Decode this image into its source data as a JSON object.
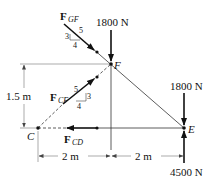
{
  "diagram": {
    "nodes": {
      "C": {
        "label": "C"
      },
      "F": {
        "label": "F"
      },
      "E": {
        "label": "E"
      }
    },
    "forces": {
      "F_GF": {
        "symbol": "F",
        "subscript": "GF",
        "slope_rise": "3",
        "slope_run": "4",
        "slope_hyp": "5"
      },
      "F_CF": {
        "symbol": "F",
        "subscript": "CF",
        "slope_rise": "3",
        "slope_run": "4",
        "slope_hyp": "5"
      },
      "F_CD": {
        "symbol": "F",
        "subscript": "CD"
      },
      "load_F": {
        "label": "1800 N"
      },
      "load_E": {
        "label": "1800 N"
      },
      "reaction_E": {
        "label": "4500 N"
      }
    },
    "dimensions": {
      "height": "1.5 m",
      "span_left": "2 m",
      "span_right": "2 m"
    }
  }
}
